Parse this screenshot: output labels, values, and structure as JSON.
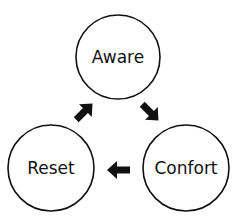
{
  "diagram": {
    "type": "cycle",
    "nodes": [
      {
        "id": "aware",
        "label": "Aware"
      },
      {
        "id": "confort",
        "label": "Confort"
      },
      {
        "id": "reset",
        "label": "Reset"
      }
    ],
    "edges": [
      {
        "from": "aware",
        "to": "confort"
      },
      {
        "from": "confort",
        "to": "reset"
      },
      {
        "from": "reset",
        "to": "aware"
      }
    ],
    "colors": {
      "stroke": "#111111",
      "background": "#ffffff"
    }
  }
}
